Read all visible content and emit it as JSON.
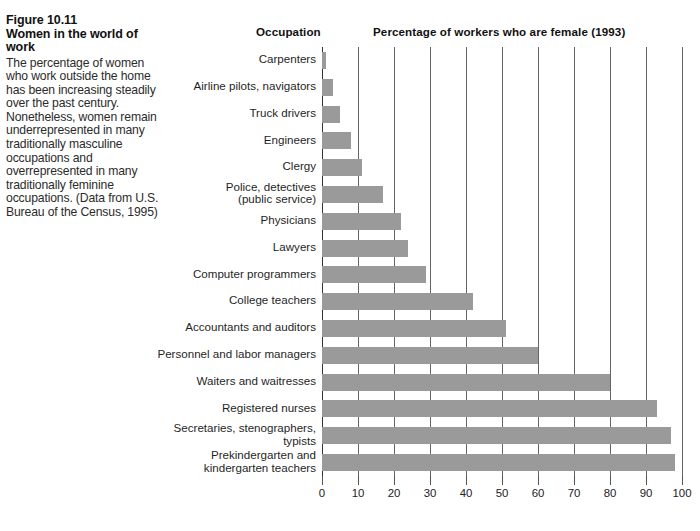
{
  "caption": {
    "figure_label": "Figure 10.11",
    "title": "Women in the world of work",
    "body": "The percentage of women who work outside the home has been increasing steadily over the past century. Nonetheless, women remain underrepresented in many traditionally masculine occupations and overrepresented in many traditionally feminine occupations. (Data from U.S. Bureau of the Census, 1995)"
  },
  "headers": {
    "occupation": "Occupation",
    "percentage": "Percentage of workers who are female (1993)"
  },
  "colors": {
    "bar_fill": "#9a9a9a",
    "gridline": "#666666",
    "text": "#1a1a1a",
    "background": "#ffffff"
  },
  "chart_data": {
    "type": "bar",
    "orientation": "horizontal",
    "title": "Percentage of workers who are female (1993)",
    "xlabel": "",
    "ylabel": "Occupation",
    "xlim": [
      0,
      100
    ],
    "xticks": [
      0,
      10,
      20,
      30,
      40,
      50,
      60,
      70,
      80,
      90,
      100
    ],
    "xtick_labels": [
      "0",
      "10",
      "20",
      "30",
      "40",
      "50",
      "60",
      "70",
      "80",
      "90",
      "100"
    ],
    "grid": true,
    "legend": "none",
    "categories": [
      "Carpenters",
      "Airline pilots, navigators",
      "Truck drivers",
      "Engineers",
      "Clergy",
      "Police, detectives\n(public service)",
      "Physicians",
      "Lawyers",
      "Computer programmers",
      "College teachers",
      "Accountants and auditors",
      "Personnel and labor managers",
      "Waiters and waitresses",
      "Registered nurses",
      "Secretaries, stenographers,\ntypists",
      "Prekindergarten and\nkindergarten teachers"
    ],
    "values": [
      1,
      3,
      5,
      8,
      11,
      17,
      22,
      24,
      29,
      42,
      51,
      60,
      80,
      93,
      97,
      98
    ]
  }
}
